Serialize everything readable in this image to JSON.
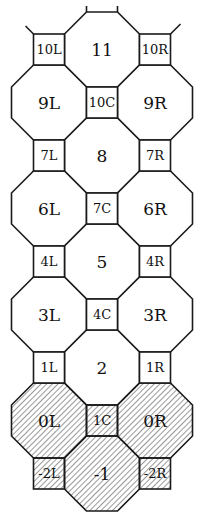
{
  "diagram": {
    "title": "",
    "geometry": {
      "column_x": {
        "L": 49,
        "C": 102,
        "R": 155
      },
      "octagon_size": 75,
      "square_size": 31,
      "top_y": 12
    },
    "colors": {
      "stroke": "#1a1a1a",
      "fill": "#ffffff",
      "hatch": "#333333"
    },
    "octagons": [
      {
        "label": "11",
        "col": "C",
        "row": 0,
        "hatched": false
      },
      {
        "label": "9L",
        "col": "L",
        "row": 1,
        "hatched": false
      },
      {
        "label": "9R",
        "col": "R",
        "row": 1,
        "hatched": false
      },
      {
        "label": "8",
        "col": "C",
        "row": 2,
        "hatched": false
      },
      {
        "label": "6L",
        "col": "L",
        "row": 3,
        "hatched": false
      },
      {
        "label": "6R",
        "col": "R",
        "row": 3,
        "hatched": false
      },
      {
        "label": "5",
        "col": "C",
        "row": 4,
        "hatched": false
      },
      {
        "label": "3L",
        "col": "L",
        "row": 5,
        "hatched": false
      },
      {
        "label": "3R",
        "col": "R",
        "row": 5,
        "hatched": false
      },
      {
        "label": "2",
        "col": "C",
        "row": 6,
        "hatched": false
      },
      {
        "label": "0L",
        "col": "L",
        "row": 7,
        "hatched": true
      },
      {
        "label": "0R",
        "col": "R",
        "row": 7,
        "hatched": true
      },
      {
        "label": "-1",
        "col": "C",
        "row": 8,
        "hatched": true
      }
    ],
    "squares": [
      {
        "label": "10L",
        "col": "L",
        "row": 0,
        "hatched": false
      },
      {
        "label": "10R",
        "col": "R",
        "row": 0,
        "hatched": false
      },
      {
        "label": "10C",
        "col": "C",
        "row": 1,
        "hatched": false
      },
      {
        "label": "7L",
        "col": "L",
        "row": 2,
        "hatched": false
      },
      {
        "label": "7R",
        "col": "R",
        "row": 2,
        "hatched": false
      },
      {
        "label": "7C",
        "col": "C",
        "row": 3,
        "hatched": false
      },
      {
        "label": "4L",
        "col": "L",
        "row": 4,
        "hatched": false
      },
      {
        "label": "4R",
        "col": "R",
        "row": 4,
        "hatched": false
      },
      {
        "label": "4C",
        "col": "C",
        "row": 5,
        "hatched": false
      },
      {
        "label": "1L",
        "col": "L",
        "row": 6,
        "hatched": false
      },
      {
        "label": "1R",
        "col": "R",
        "row": 6,
        "hatched": false
      },
      {
        "label": "1C",
        "col": "C",
        "row": 7,
        "hatched": true
      },
      {
        "label": "-2L",
        "col": "L",
        "row": 8,
        "hatched": true
      },
      {
        "label": "-2R",
        "col": "R",
        "row": 8,
        "hatched": true
      }
    ]
  }
}
